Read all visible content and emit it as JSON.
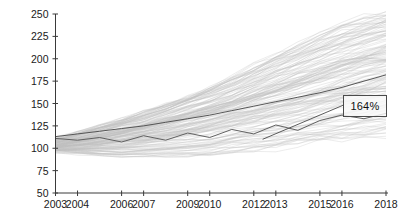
{
  "chart_data": {
    "type": "line",
    "title": "",
    "subtitle": "",
    "xlabel": "",
    "ylabel": "",
    "grid": false,
    "legend": false,
    "legend_position": "none",
    "xlim": [
      2003,
      2018
    ],
    "ylim": [
      50,
      250
    ],
    "x_ticks": [
      2003,
      2004,
      2006,
      2007,
      2009,
      2010,
      2012,
      2013,
      2015,
      2016,
      2018
    ],
    "x_tick_labels": [
      "2003",
      "2004",
      "2006",
      "2007",
      "2009",
      "2010",
      "2012",
      "2013",
      "2015",
      "2016",
      "2018"
    ],
    "y_ticks": [
      50,
      75,
      100,
      125,
      150,
      175,
      200,
      225,
      250
    ],
    "y_tick_labels": [
      "50",
      "75",
      "100",
      "125",
      "150",
      "175",
      "200",
      "225",
      "250"
    ],
    "x": [
      2003,
      2004,
      2005,
      2006,
      2007,
      2008,
      2009,
      2010,
      2011,
      2012,
      2013,
      2014,
      2015,
      2016,
      2017,
      2018
    ],
    "series_count": 150,
    "series_color": "#c0c0c0",
    "series_description": "Approximately 150 indexed trajectories rebased to 100 at 2003, fanning out from a tight bundle to a wide band between roughly 80 and 255 by 2018.",
    "bundle_envelope": {
      "upper": [
        118,
        124,
        131,
        139,
        147,
        156,
        166,
        177,
        189,
        202,
        214,
        226,
        236,
        244,
        250,
        255
      ],
      "median": [
        104,
        107,
        111,
        116,
        121,
        126,
        132,
        138,
        145,
        152,
        159,
        166,
        173,
        180,
        187,
        193
      ],
      "lower": [
        94,
        92,
        91,
        90,
        90,
        90,
        91,
        92,
        94,
        96,
        99,
        102,
        105,
        108,
        111,
        114
      ]
    },
    "series": [
      {
        "name": "highlighted-trend",
        "role": "highlight",
        "color": "#4f4f4f",
        "values": [
          113,
          116,
          119,
          122,
          125,
          129,
          133,
          137,
          142,
          147,
          152,
          157,
          162,
          168,
          175,
          182
        ]
      },
      {
        "name": "highlighted-volatile",
        "role": "highlight-jagged",
        "color": "#5a5a5a",
        "values": [
          111,
          109,
          112,
          107,
          114,
          109,
          117,
          112,
          121,
          116,
          126,
          120,
          131,
          137,
          133,
          139
        ]
      }
    ],
    "annotations": [
      {
        "name": "growth-callout",
        "label": "164%",
        "x": 2017.0,
        "y": 148,
        "leader_from": {
          "x": 2012.4,
          "y": 110
        },
        "boxed": true,
        "border_color": "#4a4a4a",
        "text_color": "#111111"
      }
    ],
    "axis_color": "#3a3a3a",
    "background_color": "#ffffff"
  }
}
